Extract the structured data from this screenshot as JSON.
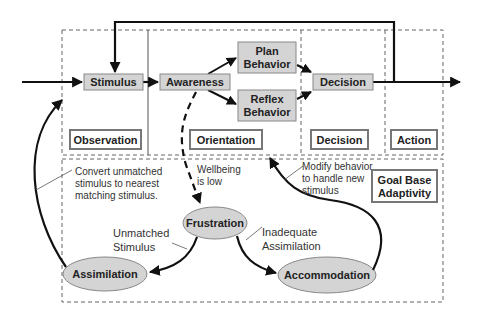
{
  "diagram": {
    "type": "OODA loop with goal-based adaptivity",
    "colors": {
      "node_fill": "#d4d4d4",
      "node_border": "#888888",
      "arrow": "#111111",
      "dashed_border": "#666666",
      "label_border": "#777777"
    },
    "process_nodes": {
      "stimulus": "Stimulus",
      "awareness": "Awareness",
      "plan_behavior": [
        "Plan",
        "Behavior"
      ],
      "reflex_behavior": [
        "Reflex",
        "Behavior"
      ],
      "decision": "Decision"
    },
    "phase_labels": {
      "observation": "Observation",
      "orientation": "Orientation",
      "decision": "Decision",
      "action": "Action",
      "goal_base_adaptivity": [
        "Goal Base",
        "Adaptivity"
      ]
    },
    "adaptivity_nodes": {
      "frustration": "Frustration",
      "assimilation": "Assimilation",
      "accommodation": "Accommodation"
    },
    "annotations": {
      "wellbeing": [
        "Wellbeing",
        "is low"
      ],
      "unmatched_stimulus": [
        "Unmatched",
        "Stimulus"
      ],
      "inadequate_assimilation": [
        "Inadequate",
        "Assimilation"
      ],
      "convert": [
        "Convert unmatched",
        "stimulus to nearest",
        "matching stimulus."
      ],
      "modify": [
        "Modify behavior",
        "to handle new",
        "stimulus"
      ]
    },
    "edges": [
      {
        "from": "input",
        "to": "Stimulus"
      },
      {
        "from": "Stimulus",
        "to": "Awareness"
      },
      {
        "from": "Awareness",
        "to": "Plan Behavior"
      },
      {
        "from": "Awareness",
        "to": "Reflex Behavior"
      },
      {
        "from": "Plan Behavior",
        "to": "Decision"
      },
      {
        "from": "Reflex Behavior",
        "to": "Decision"
      },
      {
        "from": "Decision",
        "to": "output"
      },
      {
        "from": "Decision",
        "to": "Stimulus",
        "label": "feedback loop"
      },
      {
        "from": "Awareness",
        "to": "Frustration",
        "label": "Wellbeing is low",
        "style": "dashed"
      },
      {
        "from": "Frustration",
        "to": "Assimilation",
        "label": "Unmatched Stimulus"
      },
      {
        "from": "Frustration",
        "to": "Accommodation",
        "label": "Inadequate Assimilation"
      },
      {
        "from": "Assimilation",
        "to": "Observation",
        "label": "Convert unmatched stimulus to nearest matching stimulus."
      },
      {
        "from": "Accommodation",
        "to": "Orientation",
        "label": "Modify behavior to handle new stimulus"
      }
    ]
  }
}
